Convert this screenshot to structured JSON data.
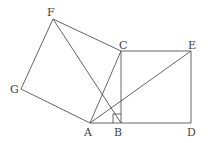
{
  "diagram": {
    "points": {
      "F": {
        "label": "F",
        "x": 53,
        "y": 19
      },
      "C": {
        "label": "C",
        "x": 121,
        "y": 51
      },
      "E": {
        "label": "E",
        "x": 191,
        "y": 51
      },
      "G": {
        "label": "G",
        "x": 21,
        "y": 89
      },
      "A": {
        "label": "A",
        "x": 90,
        "y": 123
      },
      "B": {
        "label": "B",
        "x": 121,
        "y": 123
      },
      "D": {
        "label": "D",
        "x": 191,
        "y": 123
      }
    },
    "segments": [
      "FC",
      "FG",
      "GA",
      "AC",
      "CE",
      "ED",
      "DB",
      "BA",
      "CB",
      "AE",
      "FB"
    ],
    "right_angle_at": "B"
  }
}
